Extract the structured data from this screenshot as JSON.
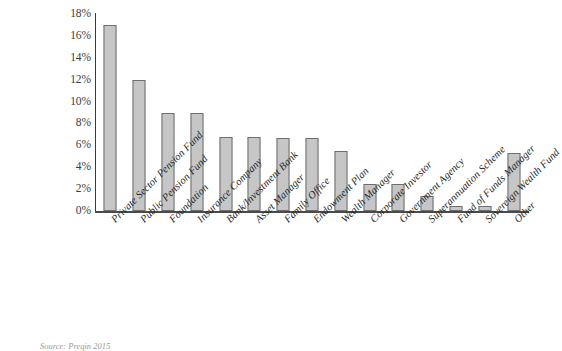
{
  "chart_data": {
    "type": "bar",
    "title": "",
    "subtitle": "",
    "xlabel": "",
    "ylabel": "",
    "ylim": [
      0,
      18
    ],
    "grid": false,
    "legend": null,
    "y_tick_labels": [
      "18%",
      "16%",
      "14%",
      "12%",
      "10%",
      "8%",
      "6%",
      "4%",
      "2%",
      "0%"
    ],
    "y_tick_values": [
      18,
      16,
      14,
      12,
      10,
      8,
      6,
      4,
      2,
      0
    ],
    "categories": [
      "Private Sector Pension Fund",
      "Public Pension Fund",
      "Foundation",
      "Insurance Company",
      "Bank/Investment Bank",
      "Asset Manager",
      "Family Office",
      "Endowment Plan",
      "Wealth Manager",
      "Corporate Investor",
      "Government Agency",
      "Superannuation Scheme",
      "Fund of Funds Manager",
      "Sovereign Wealth Fund",
      "Other"
    ],
    "values": [
      17.0,
      12.0,
      9.0,
      9.0,
      6.8,
      6.8,
      6.7,
      6.7,
      5.5,
      2.5,
      2.5,
      1.4,
      0.5,
      0.5,
      5.3
    ],
    "value_labels": [
      "17%",
      "12%",
      "9%",
      "9%",
      "6.8%",
      "6.8%",
      "6.7%",
      "6.7%",
      "5.5%",
      "2.5%",
      "2.5%",
      "1.4%",
      "0.5%",
      "0.5%",
      "5.3%"
    ],
    "bar_color": "#c6c6c6",
    "bar_border_color": "#6e6e6e",
    "axis_color": "#4a4a4a",
    "background": "#ffffff"
  },
  "footer": {
    "source_note": "Source: Preqin 2015"
  }
}
